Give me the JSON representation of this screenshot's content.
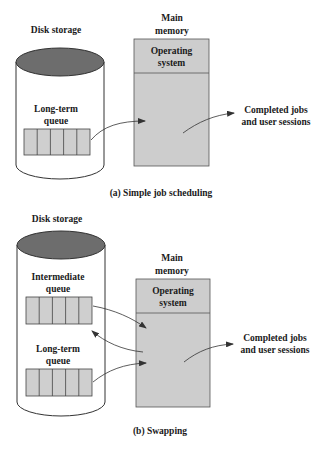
{
  "colors": {
    "disk_top": "#6d6d6d",
    "queue_fill": "#cfcfcf",
    "memory_fill": "#cdcdcd",
    "stroke": "#333333",
    "text": "#1a1a1a"
  },
  "panel_a": {
    "disk_label": "Disk storage",
    "memory_label_line1": "Main",
    "memory_label_line2": "memory",
    "os_line1": "Operating",
    "os_line2": "system",
    "queue_label_line1": "Long-term",
    "queue_label_line2": "queue",
    "queue_cells": 5,
    "output_line1": "Completed jobs",
    "output_line2": "and user sessions",
    "caption": "(a) Simple job scheduling"
  },
  "panel_b": {
    "disk_label": "Disk storage",
    "memory_label_line1": "Main",
    "memory_label_line2": "memory",
    "os_line1": "Operating",
    "os_line2": "system",
    "intermediate_label_line1": "Intermediate",
    "intermediate_label_line2": "queue",
    "longterm_label_line1": "Long-term",
    "longterm_label_line2": "queue",
    "queue_cells": 5,
    "output_line1": "Completed jobs",
    "output_line2": "and user sessions",
    "caption": "(b) Swapping"
  }
}
